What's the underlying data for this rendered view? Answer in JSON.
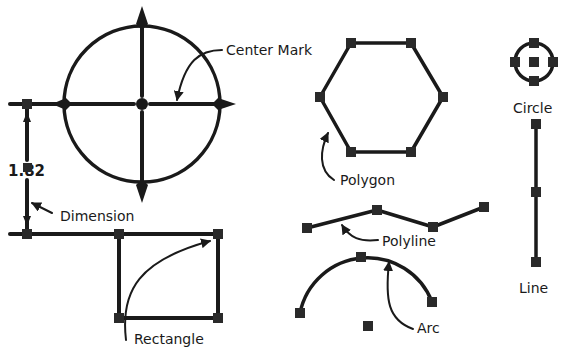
{
  "labels": {
    "center_mark": "Center Mark",
    "dimension": "Dimension",
    "dimension_value": "1.82",
    "rectangle": "Rectangle",
    "polygon": "Polygon",
    "polyline": "Polyline",
    "arc": "Arc",
    "circle": "Circle",
    "line": "Line"
  },
  "icons": {
    "grip": "square-grip-icon",
    "arrow": "arrowhead-icon"
  },
  "colors": {
    "stroke": "#1a1a1a",
    "grip": "#2a2a2a",
    "background": "#ffffff"
  }
}
